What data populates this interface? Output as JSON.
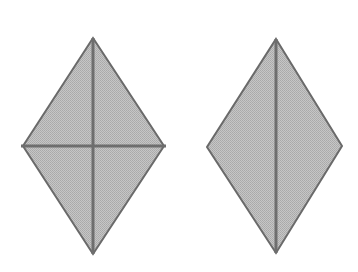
{
  "figure": {
    "name": "two-rhombus-diagonals-figure",
    "width": 358,
    "height": 272,
    "background_color": "#ffffff",
    "fill_color": "#b9b9b9",
    "fill_texture": "dither-halftone",
    "outline_color": "#6a6a6a",
    "outline_width": 2,
    "diagonal_color": "#6e6e6e",
    "diagonal_width": 3,
    "shapes": [
      {
        "id": "left-rhombus",
        "label": "",
        "vertices": {
          "top": [
            93,
            38
          ],
          "right": [
            164,
            146
          ],
          "bottom": [
            93,
            254
          ],
          "left": [
            23,
            146
          ]
        },
        "points": "93,38 164,146 93,254 23,146",
        "diagonals": [
          {
            "id": "left-vertical-diagonal",
            "orientation": "vertical",
            "from": [
              93,
              38
            ],
            "to": [
              93,
              254
            ]
          },
          {
            "id": "left-horizontal-diagonal",
            "orientation": "horizontal",
            "from": [
              21,
              146
            ],
            "to": [
              166,
              146
            ]
          }
        ]
      },
      {
        "id": "right-rhombus",
        "label": "",
        "vertices": {
          "top": [
            276,
            39
          ],
          "right": [
            342,
            146
          ],
          "bottom": [
            276,
            253
          ],
          "left": [
            207,
            147
          ]
        },
        "points": "276,39 342,146 276,253 207,147",
        "diagonals": [
          {
            "id": "right-vertical-diagonal",
            "orientation": "vertical",
            "from": [
              276,
              39
            ],
            "to": [
              276,
              253
            ]
          }
        ]
      }
    ]
  }
}
